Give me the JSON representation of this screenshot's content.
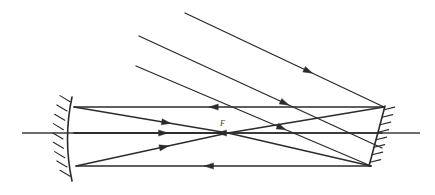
{
  "figure": {
    "width": 435,
    "height": 195,
    "background": "#ffffff",
    "stroke_color": "#2b2b2b",
    "axis_color": "#3c3c3c"
  },
  "labels": {
    "focal_point": "F"
  },
  "optical_axis": {
    "name": "optical-axis",
    "x1": 22,
    "y1": 133,
    "x2": 420,
    "y2": 133
  },
  "concave_mirror": {
    "name": "concave-mirror",
    "vertex_x": 72,
    "top_y": 97,
    "bottom_y": 181,
    "bulge": 9,
    "hatch_count": 9,
    "hatch_length": 11,
    "side": "left"
  },
  "plane_mirror": {
    "name": "plane-mirror",
    "x1": 385,
    "y1": 106,
    "x2": 369,
    "y2": 166,
    "hatch_count": 8,
    "hatch_length": 11,
    "side": "right"
  },
  "focus": {
    "x": 228,
    "y": 133
  },
  "incoming_rays": [
    {
      "name": "incoming-ray-1",
      "x1": 185,
      "y1": 13,
      "x2": 384,
      "y2": 107,
      "arrow_t": 0.62
    },
    {
      "name": "incoming-ray-2",
      "x1": 139,
      "y1": 36,
      "x2": 382,
      "y2": 148,
      "arrow_t": 0.6
    },
    {
      "name": "incoming-ray-3",
      "x1": 136,
      "y1": 66,
      "x2": 371,
      "y2": 166,
      "arrow_t": 0.62
    }
  ],
  "return_rays": [
    {
      "name": "return-ray-top",
      "x1": 384,
      "y1": 107,
      "x2": 74,
      "y2": 107,
      "arrow_t": 0.55
    },
    {
      "name": "return-ray-middle",
      "x1": 382,
      "y1": 133,
      "x2": 74,
      "y2": 133,
      "arrow_t": 0.52
    },
    {
      "name": "return-ray-bottom",
      "x1": 371,
      "y1": 166,
      "x2": 76,
      "y2": 166,
      "arrow_t": 0.55
    }
  ],
  "converging_rays": [
    {
      "name": "converging-ray-top",
      "x1": 74,
      "y1": 107,
      "x2": 228,
      "y2": 133,
      "arrow_t": 0.6
    },
    {
      "name": "converging-ray-middle",
      "x1": 74,
      "y1": 133,
      "x2": 228,
      "y2": 133,
      "arrow_t": 0.58
    },
    {
      "name": "converging-ray-bottom",
      "x1": 76,
      "y1": 166,
      "x2": 228,
      "y2": 133,
      "arrow_t": 0.58
    }
  ],
  "crossing_rays": [
    {
      "name": "crossing-ray-upper",
      "x1": 228,
      "y1": 133,
      "x2": 384,
      "y2": 107
    },
    {
      "name": "crossing-ray-lower",
      "x1": 228,
      "y1": 133,
      "x2": 371,
      "y2": 166
    }
  ]
}
